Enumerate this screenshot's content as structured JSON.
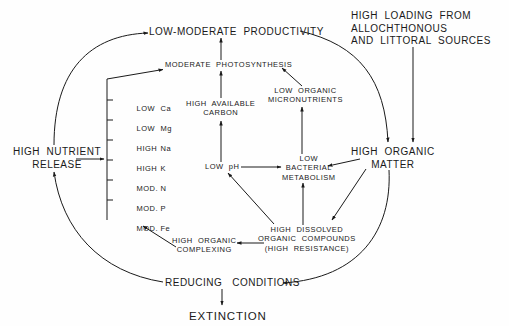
{
  "diagram": {
    "nodes": {
      "low_moderate_productivity": "LOW-MODERATE  PRODUCTIVITY",
      "moderate_photosynthesis": "MODERATE  PHOTOSYNTHESIS",
      "high_loading": "HIGH  LOADING  FROM\nALLOCHTHONOUS\nAND  LITTORAL  SOURCES",
      "high_available_carbon": "HIGH  AVAILABLE\nCARBON",
      "low_organic_micronutrients": "LOW  ORGANIC\nMICRONUTRIENTS",
      "high_nutrient_release": "HIGH  NUTRIENT\nRELEASE",
      "low_ph": "LOW  pH",
      "low_bacterial_metabolism": "LOW\nBACTERIAL\nMETABOLISM",
      "high_organic_matter": "HIGH  ORGANIC\nMATTER",
      "high_dissolved_organic_compounds": "HIGH  DISSOLVED\nORGANIC  COMPOUNDS\n(HIGH  RESISTANCE)",
      "high_organic_complexing": "HIGH  ORGANIC\nCOMPLEXING",
      "reducing_conditions": "REDUCING   CONDITIONS",
      "extinction": "EXTINCTION"
    },
    "nutrient_list": [
      {
        "level": "LOW",
        "element": "Ca"
      },
      {
        "level": "LOW",
        "element": "Mg"
      },
      {
        "level": "HIGH",
        "element": "Na"
      },
      {
        "level": "HIGH",
        "element": "K"
      },
      {
        "level": "MOD.",
        "element": "N"
      },
      {
        "level": "MOD.",
        "element": "P"
      },
      {
        "level": "MOD.",
        "element": "Fe"
      }
    ],
    "edges": [
      [
        "high_nutrient_release",
        "low_moderate_productivity"
      ],
      [
        "nutrient_list",
        "moderate_photosynthesis"
      ],
      [
        "high_nutrient_release",
        "nutrient_list"
      ],
      [
        "high_available_carbon",
        "moderate_photosynthesis"
      ],
      [
        "moderate_photosynthesis",
        "low_moderate_productivity"
      ],
      [
        "low_organic_micronutrients",
        "moderate_photosynthesis"
      ],
      [
        "low_ph",
        "high_available_carbon"
      ],
      [
        "low_bacterial_metabolism",
        "low_organic_micronutrients"
      ],
      [
        "low_ph",
        "low_bacterial_metabolism"
      ],
      [
        "high_organic_matter",
        "low_bacterial_metabolism"
      ],
      [
        "high_organic_matter",
        "high_dissolved_organic_compounds"
      ],
      [
        "high_dissolved_organic_compounds",
        "low_bacterial_metabolism"
      ],
      [
        "high_dissolved_organic_compounds",
        "low_ph"
      ],
      [
        "high_dissolved_organic_compounds",
        "high_organic_complexing"
      ],
      [
        "high_organic_complexing",
        "nutrient_list_fe"
      ],
      [
        "low_moderate_productivity",
        "high_organic_matter"
      ],
      [
        "high_loading",
        "high_organic_matter"
      ],
      [
        "high_organic_matter",
        "reducing_conditions"
      ],
      [
        "reducing_conditions",
        "high_nutrient_release"
      ],
      [
        "reducing_conditions",
        "extinction"
      ]
    ],
    "colors": {
      "ink": "#1a1a1a",
      "paper": "#fefefe"
    }
  }
}
